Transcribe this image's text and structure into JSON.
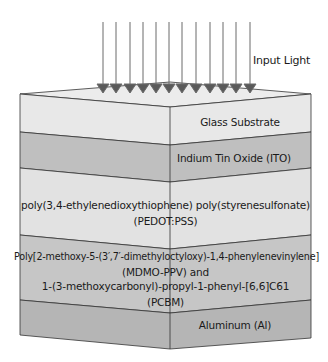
{
  "diagram": {
    "input_label": "Input Light",
    "arrow_count": 12,
    "colors": {
      "top_face": "#ececec",
      "outline": "#333333",
      "arrow": "#666666"
    },
    "layers": [
      {
        "name": "Glass Substrate",
        "lines": [
          "Glass Substrate"
        ],
        "color": "#e8e8e8"
      },
      {
        "name": "Indium Tin Oxide (ITO)",
        "lines": [
          "Indium Tin Oxide (ITO)"
        ],
        "color": "#bfbfbf"
      },
      {
        "name": "PEDOT:PSS",
        "lines": [
          "poly(3,4-ethylenedioxythiophene) poly(styrenesulfonate)",
          "(PEDOT:PSS)"
        ],
        "color": "#e2e2e2"
      },
      {
        "name": "MDMO-PPV and PCBM",
        "lines": [
          "Poly[2-methoxy-5-(3′,7′-dimethyloctyloxy)-1,4-phenylenevinylene]",
          "(MDMO-PPV) and",
          "1-(3-methoxycarbonyl)-propyl-1-phenyl-[6,6]C61",
          "(PCBM)"
        ],
        "color": "#c6c6c6"
      },
      {
        "name": "Aluminum (Al)",
        "lines": [
          "Aluminum (Al)"
        ],
        "color": "#b5b5b5"
      }
    ]
  }
}
